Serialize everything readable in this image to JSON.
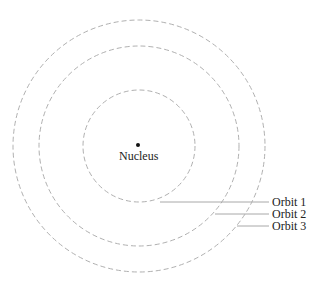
{
  "diagram": {
    "nucleus_label": "Nucleus",
    "orbits": [
      {
        "label": "Orbit 1"
      },
      {
        "label": "Orbit 2"
      },
      {
        "label": "Orbit 3"
      }
    ],
    "colors": {
      "orbit_stroke": "#b0b0b0",
      "leader_line": "#a8a8a8",
      "text": "#222222",
      "nucleus": "#111111"
    }
  }
}
